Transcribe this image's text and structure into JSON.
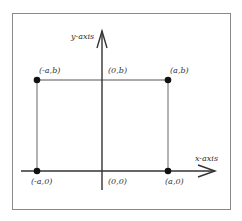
{
  "diagram": {
    "axes": {
      "x_label": "x-axis",
      "y_label": "y-axis"
    },
    "points": [
      {
        "id": "neg-a-b",
        "label": "(-a,b)"
      },
      {
        "id": "zero-b",
        "label": "(0,b)"
      },
      {
        "id": "a-b",
        "label": "(a,b)"
      },
      {
        "id": "neg-a-zero",
        "label": "(-a,0)"
      },
      {
        "id": "origin",
        "label": "(0,0)"
      },
      {
        "id": "a-zero",
        "label": "(a,0)"
      }
    ],
    "colors": {
      "frame": "#888888",
      "lines": "#444444",
      "dots": "#111111"
    }
  }
}
